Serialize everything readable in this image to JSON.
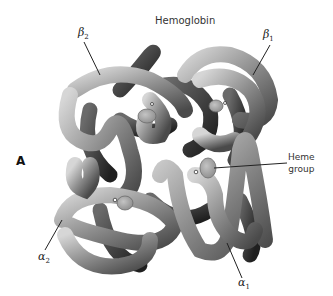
{
  "figure": {
    "title": "Hemoglobin",
    "panel_letter": "A",
    "labels": {
      "beta2": {
        "symbol": "β",
        "sub": "2"
      },
      "beta1": {
        "symbol": "β",
        "sub": "1"
      },
      "alpha2": {
        "symbol": "α",
        "sub": "2"
      },
      "alpha1": {
        "symbol": "α",
        "sub": "1"
      },
      "heme_line1": "Heme",
      "heme_line2": "group"
    },
    "colors": {
      "tube_light": "#c8c8c8",
      "tube_mid": "#8a8a8a",
      "tube_dark": "#3a3a3a",
      "heme_disc": "#a9a9a9",
      "background": "#ffffff"
    }
  }
}
